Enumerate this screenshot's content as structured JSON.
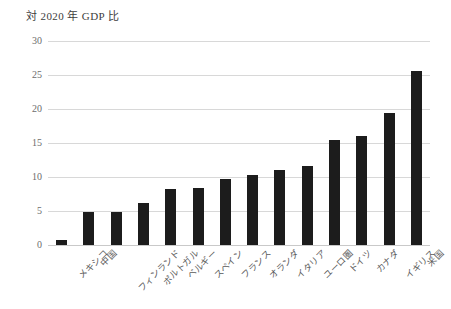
{
  "chart_data": {
    "type": "bar",
    "title": "対 2020 年 GDP 比",
    "xlabel": "",
    "ylabel": "",
    "ylim": [
      0,
      30
    ],
    "yticks": [
      0,
      5,
      10,
      15,
      20,
      25,
      30
    ],
    "grid": "horizontal",
    "legend": "none",
    "bar_color": "#1c1c1c",
    "categories": [
      "メキシコ",
      "中国",
      "フィンランド",
      "ポルトガル",
      "ベルギー",
      "スペイン",
      "フランス",
      "オランダ",
      "イタリア",
      "ユーロ圏",
      "ドイツ",
      "カナダ",
      "イギリス",
      "米国"
    ],
    "values": [
      0.7,
      4.9,
      4.9,
      6.2,
      8.2,
      8.4,
      9.7,
      10.3,
      11.1,
      11.6,
      15.4,
      16.0,
      19.4,
      25.6
    ]
  }
}
